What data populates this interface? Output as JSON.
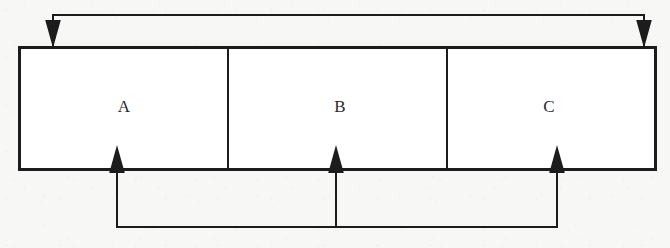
{
  "diagram": {
    "type": "block-diagram-with-feedback-paths",
    "canvas": {
      "width": 670,
      "height": 248,
      "background": "#f7f7f6"
    },
    "stroke_color": "#1c1c1c",
    "box": {
      "name": "three-segment-block",
      "x": 18,
      "y": 46,
      "width": 639,
      "height": 125,
      "fill": "#ffffff",
      "border_width": 3,
      "divider_width": 2,
      "dividers_x": [
        228,
        447
      ]
    },
    "segments": [
      {
        "id": "a",
        "label": "A",
        "center_x": 124,
        "center_y": 107,
        "x_start": 18,
        "x_end": 228
      },
      {
        "id": "b",
        "label": "B",
        "center_x": 340,
        "center_y": 107,
        "x_start": 228,
        "x_end": 447
      },
      {
        "id": "c",
        "label": "C",
        "center_x": 549,
        "center_y": 107,
        "x_start": 447,
        "x_end": 657
      }
    ],
    "top_path": {
      "name": "top-feedback-path",
      "line_y": 15,
      "x_left": 53,
      "x_right": 644,
      "drop_to_y": 46,
      "arrow_direction": "down",
      "arrowheads_x": [
        53,
        644
      ],
      "stroke_width": 2
    },
    "bottom_path": {
      "name": "bottom-feedback-path",
      "line_y": 227,
      "x_left": 117,
      "x_right": 557,
      "rise_to_y": 171,
      "arrow_direction": "up",
      "arrowheads_x": [
        117,
        336,
        557
      ],
      "stroke_width": 2
    },
    "arrowhead": {
      "width": 8,
      "height": 13
    }
  }
}
